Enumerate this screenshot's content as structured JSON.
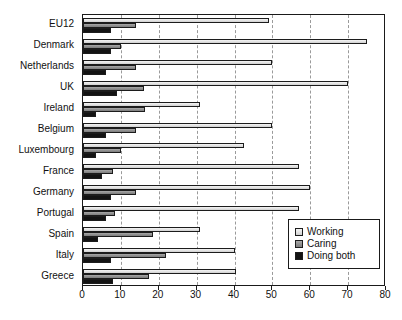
{
  "chart_data": {
    "type": "bar",
    "orientation": "horizontal",
    "title": "",
    "xlabel": "",
    "ylabel": "",
    "xlim": [
      0,
      80
    ],
    "xticks": [
      0,
      10,
      20,
      30,
      40,
      50,
      60,
      70,
      80
    ],
    "xtick_labels": [
      "0",
      "10",
      "20",
      "30",
      "40",
      "50",
      "60",
      "70",
      "80"
    ],
    "grid": true,
    "grid_axis": "x",
    "legend_position": "bottom-right",
    "categories": [
      "EU12",
      "Denmark",
      "Netherlands",
      "UK",
      "Ireland",
      "Belgium",
      "Luxembourg",
      "France",
      "Germany",
      "Portugal",
      "Spain",
      "Italy",
      "Greece"
    ],
    "series": [
      {
        "name": "Working",
        "color": "#e2e2e2",
        "values": [
          49,
          75,
          50,
          70,
          31,
          50,
          42.5,
          57,
          60,
          57,
          31,
          40,
          40.5
        ]
      },
      {
        "name": "Caring",
        "color": "#8e8e8e",
        "values": [
          14,
          10,
          14,
          16,
          16.5,
          14,
          10,
          8,
          14,
          8.5,
          18.5,
          22,
          17.5
        ]
      },
      {
        "name": "Doing both",
        "color": "#131313",
        "values": [
          7.5,
          7.5,
          6,
          9,
          3.5,
          6,
          3.5,
          5,
          7.5,
          6,
          4,
          7.5,
          8
        ]
      }
    ]
  },
  "legend": {
    "items": [
      {
        "label": "Working",
        "swatch": "working"
      },
      {
        "label": "Caring",
        "swatch": "caring"
      },
      {
        "label": "Doing both",
        "swatch": "both"
      }
    ]
  }
}
